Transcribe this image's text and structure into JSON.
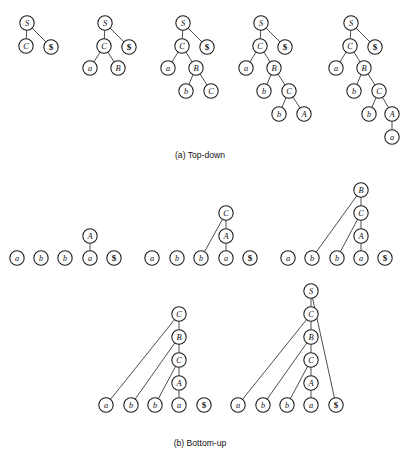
{
  "figure": {
    "width": 401,
    "height": 456,
    "background": "#ffffff",
    "node_fill": "#ffffff",
    "node_stroke": "#1a1a1a",
    "edge_stroke": "#3a3a3a",
    "node_radius": 7.2,
    "panels": [
      {
        "id": "top-down",
        "caption": "(a) Top-down",
        "caption_x": 200,
        "caption_y": 155,
        "steps": [
          {
            "id": "top-down-step-1",
            "nodes": [
              {
                "id": "n1",
                "label": "S",
                "bold": false,
                "x": 27,
                "y": 23
              },
              {
                "id": "n2",
                "label": "C",
                "bold": false,
                "x": 26,
                "y": 46
              },
              {
                "id": "n3",
                "label": "$",
                "bold": true,
                "x": 51,
                "y": 47
              }
            ],
            "edges": [
              [
                "n1",
                "n2"
              ],
              [
                "n1",
                "n3"
              ]
            ]
          },
          {
            "id": "top-down-step-2",
            "nodes": [
              {
                "id": "n1",
                "label": "S",
                "bold": false,
                "x": 105,
                "y": 23
              },
              {
                "id": "n2",
                "label": "C",
                "bold": false,
                "x": 104,
                "y": 46
              },
              {
                "id": "n3",
                "label": "$",
                "bold": true,
                "x": 129,
                "y": 47
              },
              {
                "id": "n4",
                "label": "a",
                "bold": false,
                "x": 90,
                "y": 68
              },
              {
                "id": "n5",
                "label": "B",
                "bold": false,
                "x": 118,
                "y": 68
              }
            ],
            "edges": [
              [
                "n1",
                "n2"
              ],
              [
                "n1",
                "n3"
              ],
              [
                "n2",
                "n4"
              ],
              [
                "n2",
                "n5"
              ]
            ]
          },
          {
            "id": "top-down-step-3",
            "nodes": [
              {
                "id": "n1",
                "label": "S",
                "bold": false,
                "x": 183,
                "y": 23
              },
              {
                "id": "n2",
                "label": "C",
                "bold": false,
                "x": 182,
                "y": 46
              },
              {
                "id": "n3",
                "label": "$",
                "bold": true,
                "x": 207,
                "y": 47
              },
              {
                "id": "n4",
                "label": "a",
                "bold": false,
                "x": 168,
                "y": 68
              },
              {
                "id": "n5",
                "label": "B",
                "bold": false,
                "x": 196,
                "y": 68
              },
              {
                "id": "n6",
                "label": "b",
                "bold": false,
                "x": 186,
                "y": 91
              },
              {
                "id": "n7",
                "label": "C",
                "bold": false,
                "x": 211,
                "y": 91
              }
            ],
            "edges": [
              [
                "n1",
                "n2"
              ],
              [
                "n1",
                "n3"
              ],
              [
                "n2",
                "n4"
              ],
              [
                "n2",
                "n5"
              ],
              [
                "n5",
                "n6"
              ],
              [
                "n5",
                "n7"
              ]
            ]
          },
          {
            "id": "top-down-step-4",
            "nodes": [
              {
                "id": "n1",
                "label": "S",
                "bold": false,
                "x": 261,
                "y": 23
              },
              {
                "id": "n2",
                "label": "C",
                "bold": false,
                "x": 260,
                "y": 46
              },
              {
                "id": "n3",
                "label": "$",
                "bold": true,
                "x": 285,
                "y": 47
              },
              {
                "id": "n4",
                "label": "a",
                "bold": false,
                "x": 246,
                "y": 68
              },
              {
                "id": "n5",
                "label": "B",
                "bold": false,
                "x": 274,
                "y": 68
              },
              {
                "id": "n6",
                "label": "b",
                "bold": false,
                "x": 264,
                "y": 91
              },
              {
                "id": "n7",
                "label": "C",
                "bold": false,
                "x": 289,
                "y": 91
              },
              {
                "id": "n8",
                "label": "b",
                "bold": false,
                "x": 279,
                "y": 114
              },
              {
                "id": "n9",
                "label": "A",
                "bold": false,
                "x": 304,
                "y": 114
              }
            ],
            "edges": [
              [
                "n1",
                "n2"
              ],
              [
                "n1",
                "n3"
              ],
              [
                "n2",
                "n4"
              ],
              [
                "n2",
                "n5"
              ],
              [
                "n5",
                "n6"
              ],
              [
                "n5",
                "n7"
              ],
              [
                "n7",
                "n8"
              ],
              [
                "n7",
                "n9"
              ]
            ]
          },
          {
            "id": "top-down-step-5",
            "nodes": [
              {
                "id": "n1",
                "label": "S",
                "bold": false,
                "x": 351,
                "y": 23
              },
              {
                "id": "n2",
                "label": "C",
                "bold": false,
                "x": 350,
                "y": 46
              },
              {
                "id": "n3",
                "label": "$",
                "bold": true,
                "x": 375,
                "y": 47
              },
              {
                "id": "n4",
                "label": "a",
                "bold": false,
                "x": 336,
                "y": 68
              },
              {
                "id": "n5",
                "label": "B",
                "bold": false,
                "x": 364,
                "y": 68
              },
              {
                "id": "n6",
                "label": "b",
                "bold": false,
                "x": 354,
                "y": 91
              },
              {
                "id": "n7",
                "label": "C",
                "bold": false,
                "x": 379,
                "y": 91
              },
              {
                "id": "n8",
                "label": "b",
                "bold": false,
                "x": 369,
                "y": 114
              },
              {
                "id": "n9",
                "label": "A",
                "bold": false,
                "x": 392,
                "y": 114
              },
              {
                "id": "n10",
                "label": "a",
                "bold": false,
                "x": 392,
                "y": 137
              }
            ],
            "edges": [
              [
                "n1",
                "n2"
              ],
              [
                "n1",
                "n3"
              ],
              [
                "n2",
                "n4"
              ],
              [
                "n2",
                "n5"
              ],
              [
                "n5",
                "n6"
              ],
              [
                "n5",
                "n7"
              ],
              [
                "n7",
                "n8"
              ],
              [
                "n7",
                "n9"
              ],
              [
                "n9",
                "n10"
              ]
            ]
          }
        ]
      },
      {
        "id": "bottom-up",
        "caption": "(b) Bottom-up",
        "caption_x": 200,
        "caption_y": 443,
        "steps": [
          {
            "id": "bottom-up-step-1",
            "nodes": [
              {
                "id": "l1",
                "label": "a",
                "bold": false,
                "x": 17,
                "y": 258
              },
              {
                "id": "l2",
                "label": "b",
                "bold": false,
                "x": 41,
                "y": 258
              },
              {
                "id": "l3",
                "label": "b",
                "bold": false,
                "x": 65,
                "y": 258
              },
              {
                "id": "l4",
                "label": "a",
                "bold": false,
                "x": 90,
                "y": 258
              },
              {
                "id": "l5",
                "label": "$",
                "bold": true,
                "x": 114,
                "y": 258
              },
              {
                "id": "A",
                "label": "A",
                "bold": false,
                "x": 90,
                "y": 236
              }
            ],
            "edges": [
              [
                "A",
                "l4"
              ]
            ]
          },
          {
            "id": "bottom-up-step-2",
            "nodes": [
              {
                "id": "l1",
                "label": "a",
                "bold": false,
                "x": 152,
                "y": 258
              },
              {
                "id": "l2",
                "label": "b",
                "bold": false,
                "x": 177,
                "y": 258
              },
              {
                "id": "l3",
                "label": "b",
                "bold": false,
                "x": 201,
                "y": 258
              },
              {
                "id": "l4",
                "label": "a",
                "bold": false,
                "x": 226,
                "y": 258
              },
              {
                "id": "l5",
                "label": "$",
                "bold": true,
                "x": 250,
                "y": 258
              },
              {
                "id": "A",
                "label": "A",
                "bold": false,
                "x": 226,
                "y": 236
              },
              {
                "id": "C",
                "label": "C",
                "bold": false,
                "x": 226,
                "y": 213
              }
            ],
            "edges": [
              [
                "A",
                "l4"
              ],
              [
                "C",
                "A"
              ],
              [
                "C",
                "l3"
              ]
            ]
          },
          {
            "id": "bottom-up-step-3",
            "nodes": [
              {
                "id": "l1",
                "label": "a",
                "bold": false,
                "x": 288,
                "y": 258
              },
              {
                "id": "l2",
                "label": "b",
                "bold": false,
                "x": 312,
                "y": 258
              },
              {
                "id": "l3",
                "label": "b",
                "bold": false,
                "x": 337,
                "y": 258
              },
              {
                "id": "l4",
                "label": "a",
                "bold": false,
                "x": 361,
                "y": 258
              },
              {
                "id": "l5",
                "label": "$",
                "bold": true,
                "x": 385,
                "y": 258
              },
              {
                "id": "A",
                "label": "A",
                "bold": false,
                "x": 361,
                "y": 236
              },
              {
                "id": "C",
                "label": "C",
                "bold": false,
                "x": 361,
                "y": 213
              },
              {
                "id": "B",
                "label": "B",
                "bold": false,
                "x": 361,
                "y": 190
              }
            ],
            "edges": [
              [
                "A",
                "l4"
              ],
              [
                "C",
                "A"
              ],
              [
                "C",
                "l3"
              ],
              [
                "B",
                "C"
              ],
              [
                "B",
                "l2"
              ]
            ]
          },
          {
            "id": "bottom-up-step-4",
            "nodes": [
              {
                "id": "l1",
                "label": "a",
                "bold": false,
                "x": 106,
                "y": 405
              },
              {
                "id": "l2",
                "label": "b",
                "bold": false,
                "x": 131,
                "y": 405
              },
              {
                "id": "l3",
                "label": "b",
                "bold": false,
                "x": 155,
                "y": 405
              },
              {
                "id": "l4",
                "label": "a",
                "bold": false,
                "x": 179,
                "y": 405
              },
              {
                "id": "l5",
                "label": "$",
                "bold": true,
                "x": 204,
                "y": 405
              },
              {
                "id": "A",
                "label": "A",
                "bold": false,
                "x": 179,
                "y": 383
              },
              {
                "id": "C2",
                "label": "C",
                "bold": false,
                "x": 179,
                "y": 360
              },
              {
                "id": "B",
                "label": "B",
                "bold": false,
                "x": 179,
                "y": 337
              },
              {
                "id": "C1",
                "label": "C",
                "bold": false,
                "x": 179,
                "y": 314
              }
            ],
            "edges": [
              [
                "A",
                "l4"
              ],
              [
                "C2",
                "A"
              ],
              [
                "C2",
                "l3"
              ],
              [
                "B",
                "C2"
              ],
              [
                "B",
                "l2"
              ],
              [
                "C1",
                "B"
              ],
              [
                "C1",
                "l1"
              ]
            ]
          },
          {
            "id": "bottom-up-step-5",
            "nodes": [
              {
                "id": "l1",
                "label": "a",
                "bold": false,
                "x": 238,
                "y": 405
              },
              {
                "id": "l2",
                "label": "b",
                "bold": false,
                "x": 263,
                "y": 405
              },
              {
                "id": "l3",
                "label": "b",
                "bold": false,
                "x": 287,
                "y": 405
              },
              {
                "id": "l4",
                "label": "a",
                "bold": false,
                "x": 311,
                "y": 405
              },
              {
                "id": "l5",
                "label": "$",
                "bold": true,
                "x": 336,
                "y": 405
              },
              {
                "id": "A",
                "label": "A",
                "bold": false,
                "x": 311,
                "y": 383
              },
              {
                "id": "C2",
                "label": "C",
                "bold": false,
                "x": 311,
                "y": 360
              },
              {
                "id": "B",
                "label": "B",
                "bold": false,
                "x": 311,
                "y": 337
              },
              {
                "id": "C1",
                "label": "C",
                "bold": false,
                "x": 311,
                "y": 314
              },
              {
                "id": "S",
                "label": "S",
                "bold": false,
                "x": 311,
                "y": 291
              }
            ],
            "edges": [
              [
                "A",
                "l4"
              ],
              [
                "C2",
                "A"
              ],
              [
                "C2",
                "l3"
              ],
              [
                "B",
                "C2"
              ],
              [
                "B",
                "l2"
              ],
              [
                "C1",
                "B"
              ],
              [
                "C1",
                "l1"
              ],
              [
                "S",
                "C1"
              ],
              [
                "S",
                "l5"
              ]
            ]
          }
        ]
      }
    ]
  }
}
